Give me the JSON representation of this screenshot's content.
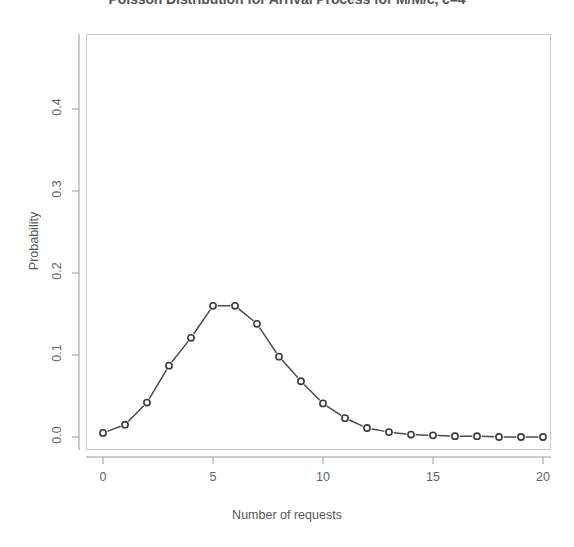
{
  "chart_data": {
    "type": "line",
    "title": "Poisson Distribution for Arrival Process for M/M/c, c=4",
    "xlabel": "Number of requests",
    "ylabel": "Probability",
    "x": [
      0,
      1,
      2,
      3,
      4,
      5,
      6,
      7,
      8,
      9,
      10,
      11,
      12,
      13,
      14,
      15,
      16,
      17,
      18,
      19,
      20
    ],
    "values": [
      0.005,
      0.015,
      0.042,
      0.087,
      0.121,
      0.16,
      0.16,
      0.138,
      0.098,
      0.068,
      0.041,
      0.023,
      0.011,
      0.006,
      0.003,
      0.002,
      0.001,
      0.001,
      0.0,
      0.0,
      0.0
    ],
    "series": [
      {
        "name": "Poisson PMF",
        "values": [
          0.005,
          0.015,
          0.042,
          0.087,
          0.121,
          0.16,
          0.16,
          0.138,
          0.098,
          0.068,
          0.041,
          0.023,
          0.011,
          0.006,
          0.003,
          0.002,
          0.001,
          0.001,
          0.0,
          0.0,
          0.0
        ]
      }
    ],
    "xlim": [
      -1,
      21
    ],
    "ylim": [
      0.0,
      0.47
    ],
    "xticks": [
      0,
      5,
      10,
      15,
      20
    ],
    "xtick_labels": [
      "0",
      "5",
      "10",
      "15",
      "20"
    ],
    "yticks": [
      0.0,
      0.1,
      0.2,
      0.3,
      0.4
    ],
    "ytick_labels": [
      "0.0",
      "0.1",
      "0.2",
      "0.3",
      "0.4"
    ],
    "grid": false,
    "legend": "none",
    "marker": "open-circle",
    "linestyle": "dashed",
    "line_color": "#4a4a4a",
    "marker_color": "#3a3a3a",
    "panel_border_color": "#c9c9c9"
  }
}
